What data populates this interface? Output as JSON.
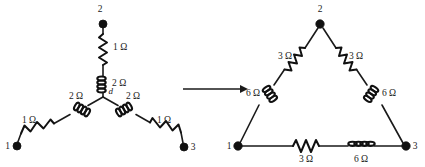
{
  "figure": {
    "background_color": "#ffffff",
    "ink_color": "#1a1a1a"
  },
  "transform_arrow": {
    "name": "transformation-arrow",
    "direction": "right",
    "label": ""
  },
  "wye": {
    "name": "wye-network",
    "center_node_label": "d",
    "terminals": [
      {
        "id": "2",
        "label": "2",
        "x": 103,
        "y": 24
      },
      {
        "id": "1",
        "label": "1",
        "x": 17,
        "y": 146
      },
      {
        "id": "3",
        "label": "3",
        "x": 184,
        "y": 147
      }
    ],
    "branches": [
      {
        "name": "branch-d-to-2",
        "inductor_label": "2 Ω",
        "resistor_label": "1 Ω"
      },
      {
        "name": "branch-d-to-1",
        "inductor_label": "2 Ω",
        "resistor_label": "1 Ω"
      },
      {
        "name": "branch-d-to-3",
        "inductor_label": "2 Ω",
        "resistor_label": "1 Ω"
      }
    ]
  },
  "delta": {
    "name": "delta-network",
    "terminals": [
      {
        "id": "2",
        "label": "2",
        "x": 320,
        "y": 24
      },
      {
        "id": "1",
        "label": "1",
        "x": 238,
        "y": 146
      },
      {
        "id": "3",
        "label": "3",
        "x": 406,
        "y": 146
      }
    ],
    "branches": [
      {
        "name": "branch-1-to-2",
        "resistor_label": "3 Ω",
        "inductor_label": "6 Ω"
      },
      {
        "name": "branch-2-to-3",
        "resistor_label": "3 Ω",
        "inductor_label": "6 Ω"
      },
      {
        "name": "branch-1-to-3",
        "resistor_label": "3 Ω",
        "inductor_label": "6 Ω"
      }
    ]
  }
}
